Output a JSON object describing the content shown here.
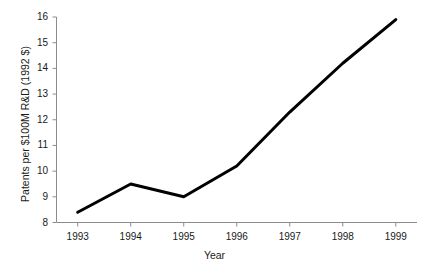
{
  "chart_data": {
    "type": "line",
    "title": "",
    "subtitle": "",
    "xlabel": "Year",
    "ylabel": "Patents per $100M R&D (1992 $)",
    "categories": [
      "1993",
      "1994",
      "1995",
      "1996",
      "1997",
      "1998",
      "1999"
    ],
    "x": [
      1993,
      1994,
      1995,
      1996,
      1997,
      1998,
      1999
    ],
    "values": [
      8.4,
      9.5,
      9.0,
      10.2,
      12.3,
      14.2,
      15.9
    ],
    "series": [
      {
        "name": "Patents per $100M R&D",
        "values": [
          8.4,
          9.5,
          9.0,
          10.2,
          12.3,
          14.2,
          15.9
        ]
      }
    ],
    "xlim": [
      1992.6,
      1999.4
    ],
    "ylim": [
      8,
      16
    ],
    "y_ticks": [
      8,
      9,
      10,
      11,
      12,
      13,
      14,
      15,
      16
    ],
    "y_tick_labels": [
      "8",
      "9",
      "10",
      "11",
      "12",
      "13",
      "14",
      "15",
      "16"
    ],
    "x_ticks": [
      1993,
      1994,
      1995,
      1996,
      1997,
      1998,
      1999
    ],
    "x_tick_labels": [
      "1993",
      "1994",
      "1995",
      "1996",
      "1997",
      "1998",
      "1999"
    ],
    "grid": false,
    "legend": false,
    "legend_position": "none",
    "markers": false,
    "line_color": "#000000",
    "line_width": 3,
    "axis_color": "#8c8c8c",
    "background_color": "#ffffff",
    "text_color": "#1a1a1a",
    "annotations": []
  }
}
